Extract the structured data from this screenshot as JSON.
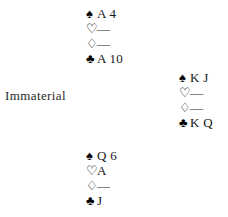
{
  "diagram": {
    "type": "bridge-hand-diagram",
    "background_color": "#ffffff",
    "ink_color": "#161616"
  },
  "suit_symbols": {
    "spades": "♠",
    "hearts": "♡",
    "diamonds": "♢",
    "clubs": "♣"
  },
  "suit_names": {
    "spades": "spade-suit-symbol",
    "hearts": "heart-suit-symbol",
    "diamonds": "diamond-suit-symbol",
    "clubs": "club-suit-symbol"
  },
  "void_marker": "—",
  "hands": {
    "north": {
      "position_label": "north",
      "spades": "A 4",
      "hearts": "—",
      "diamonds": "—",
      "clubs": "A 10"
    },
    "east": {
      "position_label": "east",
      "spades": "K J",
      "hearts": "—",
      "diamonds": "—",
      "clubs": "K Q"
    },
    "south": {
      "position_label": "south",
      "spades": "Q 6",
      "hearts": "A",
      "diamonds": "—",
      "clubs": "J"
    },
    "west": {
      "position_label": "west",
      "text": "Immaterial"
    }
  }
}
